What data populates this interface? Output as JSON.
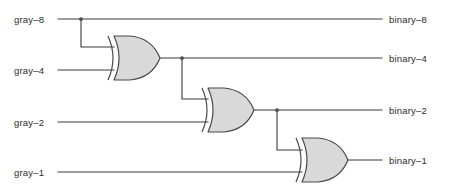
{
  "diagram": {
    "type": "logic-circuit",
    "stroke_color": "#3a3a3a",
    "gate_fill_color": "#d9d9d9",
    "gate_stroke_color": "#4a4a4a",
    "background_color": "#ffffff"
  },
  "inputs": [
    {
      "id": "gray-8",
      "label": "gray–8",
      "y": 19
    },
    {
      "id": "gray-4",
      "label": "gray–4",
      "y": 70
    },
    {
      "id": "gray-2",
      "label": "gray–2",
      "y": 122
    },
    {
      "id": "gray-1",
      "label": "gray–1",
      "y": 172
    }
  ],
  "outputs": [
    {
      "id": "binary-8",
      "label": "binary–8",
      "y": 19
    },
    {
      "id": "binary-4",
      "label": "binary–4",
      "y": 58
    },
    {
      "id": "binary-2",
      "label": "binary–2",
      "y": 110
    },
    {
      "id": "binary-1",
      "label": "binary–1",
      "y": 160
    }
  ],
  "gates": [
    {
      "id": "xor-1",
      "type": "XOR",
      "inputs": [
        "gray-8",
        "gray-4"
      ],
      "output": "binary-4",
      "x": 110,
      "y": 58
    },
    {
      "id": "xor-2",
      "type": "XOR",
      "inputs": [
        "binary-4",
        "gray-2"
      ],
      "output": "binary-2",
      "x": 204,
      "y": 110
    },
    {
      "id": "xor-3",
      "type": "XOR",
      "inputs": [
        "binary-2",
        "gray-1"
      ],
      "output": "binary-1",
      "x": 298,
      "y": 160
    }
  ]
}
